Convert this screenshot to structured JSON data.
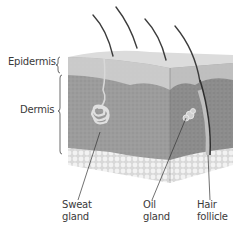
{
  "figure": {
    "layer_labels": [
      {
        "id": "epidermis",
        "text": "Epidermis"
      },
      {
        "id": "dermis",
        "text": "Dermis"
      }
    ],
    "structure_labels": [
      {
        "id": "sweat-gland",
        "line1": "Sweat",
        "line2": "gland"
      },
      {
        "id": "oil-gland",
        "line1": "Oil",
        "line2": "gland"
      },
      {
        "id": "hair-follicle",
        "line1": "Hair",
        "line2": "follicle"
      }
    ],
    "colors": {
      "background": "#ffffff",
      "top_surface": "#dcdcdc",
      "epidermis": "#c8c8c8",
      "dermis_front": "#9a9a9a",
      "dermis_side": "#8a8a8a",
      "fat": "#e8e8e8",
      "hair": "#3c3c3c",
      "label_text": "#3a3a3a",
      "leader_line": "#333333"
    }
  }
}
